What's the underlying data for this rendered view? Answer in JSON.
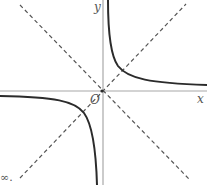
{
  "diagram": {
    "labels": {
      "x_axis": "x",
      "y_axis": "y",
      "origin": "O",
      "fragment": "∞."
    },
    "colors": {
      "curve": "#2b2b2b",
      "axis": "#9a9a9a",
      "dashed": "#555555",
      "background": "#ffffff"
    }
  }
}
